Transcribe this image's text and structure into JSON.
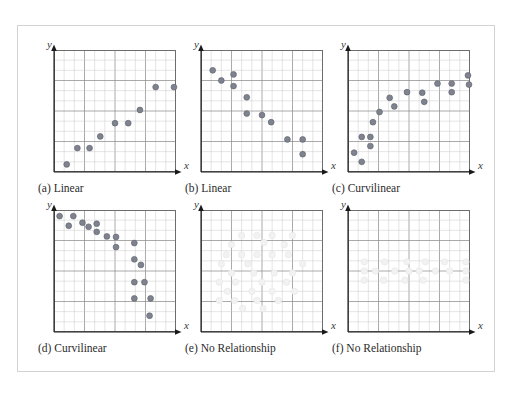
{
  "figure": {
    "background_color": "#ffffff",
    "frame_border_color": "#d2d2d2",
    "grid_minor_color": "#c8c8c8",
    "grid_major_color": "#8e8e8e",
    "box_border_color": "#6d6d6d",
    "axis_color": "#1a1a1a",
    "point_color": "#7f838f",
    "point_edge_color": "#62656f",
    "faint_point_color": "#f2f2f2",
    "faint_point_edge_color": "#e6e6e6",
    "grid_cells_x": 12,
    "grid_cells_y": 12,
    "axis_label_x": "x",
    "axis_label_y": "y"
  },
  "chart_data": [
    {
      "id": "a",
      "type": "scatter",
      "title": "(a) Linear",
      "caption": "(a) Linear",
      "xlabel": "x",
      "ylabel": "y",
      "xlim": [
        0,
        12
      ],
      "ylim": [
        0,
        12
      ],
      "grid": true,
      "relationship": "positive linear",
      "point_style": "solid",
      "points": [
        [
          1.25,
          0.75
        ],
        [
          2.3,
          2.35
        ],
        [
          3.5,
          2.35
        ],
        [
          4.55,
          3.5
        ],
        [
          6.0,
          4.8
        ],
        [
          7.3,
          4.8
        ],
        [
          8.45,
          6.1
        ],
        [
          10.0,
          8.35
        ],
        [
          11.8,
          8.35
        ]
      ]
    },
    {
      "id": "b",
      "type": "scatter",
      "title": "(b) Linear",
      "caption": "(b) Linear",
      "xlabel": "x",
      "ylabel": "y",
      "xlim": [
        0,
        12
      ],
      "ylim": [
        0,
        12
      ],
      "grid": true,
      "relationship": "negative linear",
      "point_style": "solid",
      "points": [
        [
          1.15,
          10.0
        ],
        [
          2.0,
          9.0
        ],
        [
          3.2,
          9.6
        ],
        [
          3.2,
          8.45
        ],
        [
          4.5,
          7.35
        ],
        [
          4.5,
          5.75
        ],
        [
          6.0,
          5.6
        ],
        [
          6.9,
          4.9
        ],
        [
          8.5,
          3.2
        ],
        [
          10.0,
          3.2
        ],
        [
          10.0,
          1.75
        ]
      ]
    },
    {
      "id": "c",
      "type": "scatter",
      "title": "(c) Curvilinear",
      "caption": "(c) Curvilinear",
      "xlabel": "x",
      "ylabel": "y",
      "xlim": [
        0,
        12
      ],
      "ylim": [
        0,
        12
      ],
      "grid": true,
      "relationship": "curvilinear increasing, leveling off",
      "point_style": "solid",
      "points": [
        [
          0.6,
          1.9
        ],
        [
          1.35,
          1.0
        ],
        [
          1.35,
          3.45
        ],
        [
          2.2,
          3.45
        ],
        [
          2.2,
          2.55
        ],
        [
          2.45,
          4.9
        ],
        [
          3.1,
          5.9
        ],
        [
          4.1,
          7.3
        ],
        [
          4.55,
          6.45
        ],
        [
          5.8,
          7.85
        ],
        [
          7.3,
          7.8
        ],
        [
          7.5,
          6.9
        ],
        [
          8.8,
          8.7
        ],
        [
          10.2,
          8.7
        ],
        [
          10.2,
          7.85
        ],
        [
          11.8,
          9.5
        ],
        [
          11.9,
          8.6
        ]
      ]
    },
    {
      "id": "d",
      "type": "scatter",
      "title": "(d) Curvilinear",
      "caption": "(d) Curvilinear",
      "xlabel": "x",
      "ylabel": "y",
      "xlim": [
        0,
        12
      ],
      "ylim": [
        0,
        12
      ],
      "grid": true,
      "relationship": "curvilinear decreasing, steep drop at high x",
      "point_style": "solid",
      "points": [
        [
          0.55,
          11.4
        ],
        [
          1.9,
          11.4
        ],
        [
          1.45,
          10.45
        ],
        [
          2.8,
          10.75
        ],
        [
          3.4,
          10.35
        ],
        [
          4.2,
          10.65
        ],
        [
          4.2,
          9.85
        ],
        [
          5.2,
          9.4
        ],
        [
          6.1,
          9.35
        ],
        [
          6.1,
          8.35
        ],
        [
          7.9,
          8.75
        ],
        [
          7.9,
          7.15
        ],
        [
          8.55,
          6.6
        ],
        [
          7.9,
          4.9
        ],
        [
          8.9,
          4.9
        ],
        [
          7.9,
          3.3
        ],
        [
          9.5,
          3.3
        ],
        [
          9.4,
          1.6
        ]
      ]
    },
    {
      "id": "e",
      "type": "scatter",
      "title": "(e) No Relationship",
      "caption": "(e) No Relationship",
      "xlabel": "x",
      "ylabel": "y",
      "xlim": [
        0,
        12
      ],
      "ylim": [
        0,
        12
      ],
      "grid": true,
      "relationship": "none (diffuse cloud)",
      "point_style": "faint",
      "points": [
        [
          4.0,
          9.5
        ],
        [
          5.5,
          9.5
        ],
        [
          7.0,
          9.5
        ],
        [
          9.0,
          9.5
        ],
        [
          3.0,
          8.6
        ],
        [
          6.2,
          8.8
        ],
        [
          8.2,
          8.6
        ],
        [
          2.5,
          7.6
        ],
        [
          4.0,
          7.6
        ],
        [
          5.5,
          7.6
        ],
        [
          7.0,
          7.6
        ],
        [
          8.6,
          7.6
        ],
        [
          2.0,
          6.7
        ],
        [
          4.6,
          6.7
        ],
        [
          10.0,
          6.7
        ],
        [
          3.0,
          5.8
        ],
        [
          5.2,
          5.8
        ],
        [
          7.2,
          5.8
        ],
        [
          9.0,
          5.8
        ],
        [
          1.8,
          4.9
        ],
        [
          3.4,
          4.9
        ],
        [
          6.0,
          4.9
        ],
        [
          8.4,
          4.9
        ],
        [
          2.6,
          4.0
        ],
        [
          5.0,
          4.0
        ],
        [
          7.0,
          4.0
        ],
        [
          9.2,
          4.0
        ],
        [
          1.8,
          3.1
        ],
        [
          3.3,
          3.1
        ],
        [
          5.5,
          3.1
        ],
        [
          7.6,
          3.1
        ],
        [
          4.1,
          2.3
        ],
        [
          6.1,
          2.3
        ]
      ]
    },
    {
      "id": "f",
      "type": "scatter",
      "title": "(f) No Relationship",
      "caption": "(f) No Relationship",
      "xlabel": "x",
      "ylabel": "y",
      "xlim": [
        0,
        12
      ],
      "ylim": [
        0,
        12
      ],
      "grid": true,
      "relationship": "none (flat horizontal band)",
      "point_style": "faint",
      "points": [
        [
          1.6,
          6.9
        ],
        [
          3.6,
          6.9
        ],
        [
          5.8,
          6.9
        ],
        [
          7.6,
          6.9
        ],
        [
          9.5,
          6.9
        ],
        [
          11.6,
          6.9
        ],
        [
          1.6,
          6.0
        ],
        [
          2.7,
          6.0
        ],
        [
          4.6,
          6.0
        ],
        [
          6.0,
          6.0
        ],
        [
          7.0,
          6.0
        ],
        [
          8.6,
          6.0
        ],
        [
          10.0,
          6.0
        ],
        [
          11.6,
          6.0
        ],
        [
          1.6,
          5.1
        ],
        [
          3.5,
          5.1
        ],
        [
          5.6,
          5.1
        ],
        [
          7.4,
          5.1
        ],
        [
          11.6,
          5.1
        ]
      ]
    }
  ]
}
